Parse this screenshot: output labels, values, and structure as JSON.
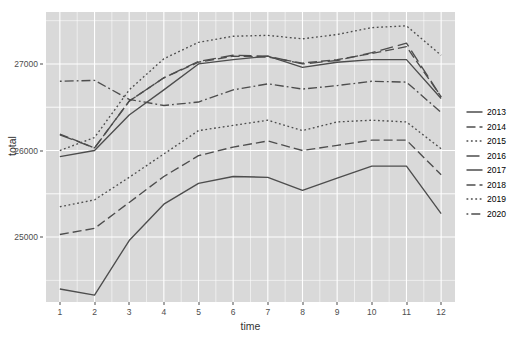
{
  "chart_data": {
    "type": "line",
    "title": "",
    "xlabel": "time",
    "ylabel": "total",
    "x": [
      1,
      2,
      3,
      4,
      5,
      6,
      7,
      8,
      9,
      10,
      11,
      12
    ],
    "xlim": [
      0.6,
      12.4
    ],
    "ylim": [
      24250,
      27600
    ],
    "yticks": [
      25000,
      26000,
      27000
    ],
    "ytick_labels": [
      "25000",
      "26000",
      "27000"
    ],
    "xtick_labels": [
      "1",
      "2",
      "3",
      "4",
      "5",
      "6",
      "7",
      "8",
      "9",
      "10",
      "11",
      "12"
    ],
    "grid": true,
    "legend_position": "right",
    "panel_background": "#d9d9d9",
    "grid_color": "#ffffff",
    "line_color": "#4d4d4d",
    "series": [
      {
        "name": "2013",
        "dash": "solid",
        "values": [
          24400,
          24330,
          24960,
          25380,
          25620,
          25700,
          25690,
          25540,
          25680,
          25820,
          25820,
          25270
        ]
      },
      {
        "name": "2014",
        "dash": "dashed",
        "values": [
          25030,
          25100,
          25400,
          25700,
          25940,
          26040,
          26110,
          26000,
          26060,
          26120,
          26120,
          25720
        ]
      },
      {
        "name": "2015",
        "dash": "dotted",
        "values": [
          25350,
          25430,
          25690,
          25960,
          26230,
          26290,
          26350,
          26230,
          26330,
          26350,
          26330,
          26020
        ]
      },
      {
        "name": "2016",
        "dash": "longdash",
        "values": [
          26180,
          26030,
          26570,
          26840,
          27030,
          27100,
          27090,
          27000,
          27040,
          27130,
          27240,
          26620
        ]
      },
      {
        "name": "2017",
        "dash": "solid",
        "values": [
          25930,
          26000,
          26410,
          26700,
          27000,
          27050,
          27090,
          26960,
          27020,
          27050,
          27050,
          26600
        ]
      },
      {
        "name": "2018",
        "dash": "dashed",
        "values": [
          26190,
          26030,
          26570,
          26840,
          27020,
          27090,
          27080,
          27010,
          27050,
          27120,
          27200,
          26620
        ]
      },
      {
        "name": "2019",
        "dash": "dotted",
        "values": [
          26000,
          26150,
          26700,
          27060,
          27250,
          27320,
          27330,
          27290,
          27340,
          27420,
          27440,
          27100
        ]
      },
      {
        "name": "2020",
        "dash": "dotdash",
        "values": [
          26800,
          26810,
          26590,
          26520,
          26560,
          26700,
          26770,
          26710,
          26750,
          26800,
          26790,
          26440
        ]
      }
    ]
  },
  "legend": {
    "entries": [
      "2013",
      "2014",
      "2015",
      "2016",
      "2017",
      "2018",
      "2019",
      "2020"
    ]
  }
}
